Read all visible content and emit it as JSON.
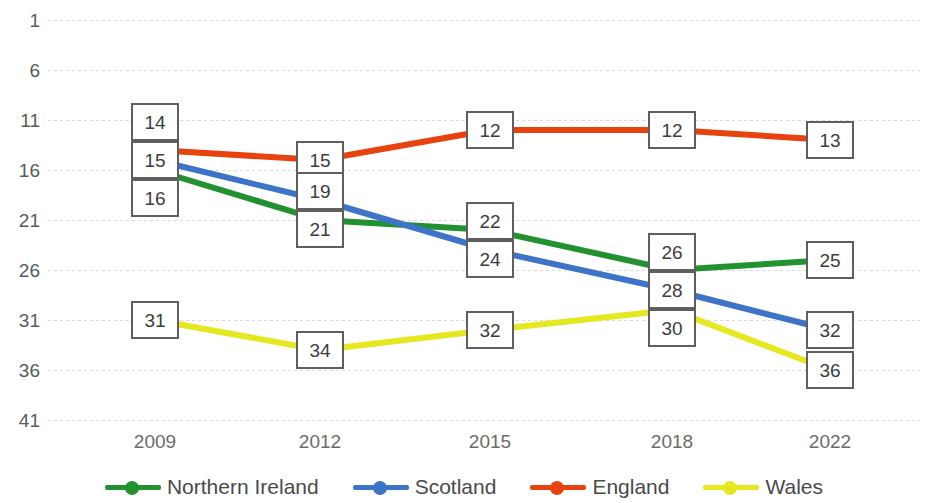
{
  "chart_data": {
    "type": "line",
    "title": "",
    "subtitle": "",
    "xlabel": "",
    "ylabel": "",
    "categories": [
      "2009",
      "2012",
      "2015",
      "2018",
      "2022"
    ],
    "x": [
      2009,
      2012,
      2015,
      2018,
      2022
    ],
    "ylim": [
      1,
      41
    ],
    "y_inverted": true,
    "y_ticks": [
      1,
      6,
      11,
      16,
      21,
      26,
      31,
      36,
      41
    ],
    "grid": true,
    "grid_axis": "y",
    "legend_position": "bottom",
    "data_labels": true,
    "series": [
      {
        "name": "Northern Ireland",
        "color": "#21922f",
        "values": [
          16,
          21,
          22,
          26,
          25
        ]
      },
      {
        "name": "Scotland",
        "color": "#3d74c8",
        "values": [
          15,
          19,
          24,
          28,
          32
        ]
      },
      {
        "name": "England",
        "color": "#e8420e",
        "values": [
          14,
          15,
          12,
          12,
          13
        ]
      },
      {
        "name": "Wales",
        "color": "#e5e81f",
        "values": [
          31,
          34,
          32,
          30,
          36
        ]
      }
    ]
  },
  "axis": {
    "y_tick_labels": [
      "1",
      "6",
      "11",
      "16",
      "21",
      "26",
      "31",
      "36",
      "41"
    ],
    "x_tick_labels": [
      "2009",
      "2012",
      "2015",
      "2018",
      "2022"
    ]
  },
  "legend": {
    "items": [
      {
        "label": "Northern Ireland",
        "color": "#21922f"
      },
      {
        "label": "Scotland",
        "color": "#3d74c8"
      },
      {
        "label": "England",
        "color": "#e8420e"
      },
      {
        "label": "Wales",
        "color": "#e5e81f"
      }
    ]
  },
  "colors": {
    "northern_ireland": "#21922f",
    "scotland": "#3d74c8",
    "england": "#e8420e",
    "wales": "#e5e81f",
    "gridline": "#d9d9d9",
    "axis_text": "#5a5a5a",
    "label_border": "#5f5f5f",
    "background": "#ffffff"
  }
}
